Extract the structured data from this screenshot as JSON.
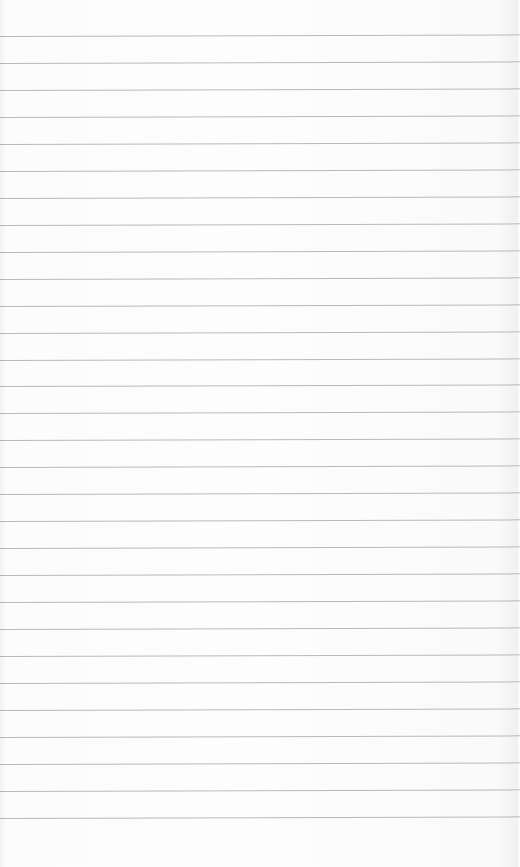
{
  "page": {
    "type": "lined-paper",
    "line_count": 30,
    "first_line_y": 36,
    "line_spacing": 26.96,
    "line_color": "#b9b9b9",
    "background_color": "#fbfbfb"
  }
}
